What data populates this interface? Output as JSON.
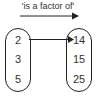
{
  "title": "'is a factor of'",
  "domain_set": [
    "2",
    "3",
    "5"
  ],
  "codomain_set": [
    "14",
    "15",
    "25"
  ],
  "mappings": [
    {
      "from": "2",
      "to": "14"
    }
  ]
}
